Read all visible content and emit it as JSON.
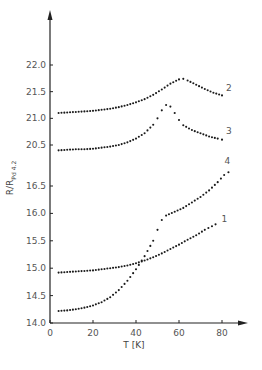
{
  "chart_data": {
    "type": "scatter",
    "title": "",
    "xlabel": "T [K]",
    "ylabel": "R/R_Pd 4.2",
    "ylabel_main": "R/R",
    "ylabel_sub": "Pd 4.2",
    "xlim": [
      0,
      90
    ],
    "x_ticks": [
      0,
      20,
      40,
      60,
      80
    ],
    "y_axis_broken": true,
    "y_ticks_upper": [
      "20.5",
      "21.0",
      "21.5",
      "22.0"
    ],
    "y_ticks_lower": [
      "14.0",
      "14.5",
      "15.0",
      "15.5",
      "16.0",
      "16.5"
    ],
    "ylim_upper": [
      20.5,
      22.0
    ],
    "ylim_lower": [
      14.0,
      16.5
    ],
    "grid": false,
    "legend": "inline curve numbers",
    "series": [
      {
        "name": "1",
        "label": "1",
        "panel": "lower",
        "x": [
          4,
          8,
          12,
          16,
          20,
          24,
          28,
          32,
          36,
          40,
          44,
          48,
          52,
          56,
          60,
          64,
          68,
          72,
          77
        ],
        "y": [
          14.92,
          14.93,
          14.94,
          14.95,
          14.96,
          14.98,
          15.0,
          15.02,
          15.05,
          15.09,
          15.14,
          15.2,
          15.27,
          15.35,
          15.43,
          15.52,
          15.6,
          15.7,
          15.8
        ]
      },
      {
        "name": "2",
        "label": "2",
        "panel": "upper",
        "x": [
          4,
          8,
          12,
          16,
          20,
          24,
          28,
          32,
          36,
          40,
          44,
          48,
          52,
          56,
          60,
          62,
          64,
          68,
          72,
          76,
          80
        ],
        "y": [
          21.1,
          21.11,
          21.12,
          21.13,
          21.14,
          21.16,
          21.18,
          21.21,
          21.25,
          21.3,
          21.36,
          21.44,
          21.54,
          21.65,
          21.73,
          21.74,
          21.71,
          21.63,
          21.55,
          21.48,
          21.43
        ]
      },
      {
        "name": "3",
        "label": "3",
        "panel": "upper",
        "x": [
          4,
          8,
          12,
          16,
          20,
          24,
          28,
          32,
          36,
          40,
          44,
          48,
          50,
          52,
          54,
          56,
          58,
          60,
          62,
          66,
          70,
          74,
          78,
          80
        ],
        "y": [
          20.4,
          20.41,
          20.42,
          20.42,
          20.43,
          20.45,
          20.47,
          20.5,
          20.55,
          20.62,
          20.72,
          20.88,
          21.0,
          21.15,
          21.25,
          21.22,
          21.1,
          20.97,
          20.87,
          20.78,
          20.72,
          20.66,
          20.62,
          20.6
        ]
      },
      {
        "name": "4",
        "label": "4",
        "panel": "lower",
        "x": [
          4,
          8,
          12,
          16,
          20,
          24,
          28,
          32,
          36,
          40,
          44,
          48,
          50,
          52,
          54,
          58,
          62,
          66,
          70,
          74,
          78,
          81,
          83
        ],
        "y": [
          14.22,
          14.23,
          14.25,
          14.28,
          14.32,
          14.38,
          14.47,
          14.6,
          14.77,
          14.98,
          15.22,
          15.5,
          15.7,
          15.88,
          15.96,
          16.03,
          16.1,
          16.2,
          16.3,
          16.42,
          16.57,
          16.7,
          16.75
        ]
      }
    ]
  }
}
